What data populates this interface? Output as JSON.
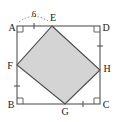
{
  "figure": {
    "outer_square": {
      "name": "ABCD",
      "corners": [
        {
          "label": "A",
          "position": "top-left",
          "x": 17,
          "y": 26
        },
        {
          "label": "D",
          "position": "top-right",
          "x": 100,
          "y": 26
        },
        {
          "label": "C",
          "position": "bottom-right",
          "x": 100,
          "y": 104
        },
        {
          "label": "B",
          "position": "bottom-left",
          "x": 17,
          "y": 104
        }
      ]
    },
    "inner_square": {
      "name": "EFGH",
      "fill_color": "#d4d4d4",
      "stroke_color": "#4a4a4a",
      "vertices": [
        {
          "label": "E",
          "lies_on": "AD",
          "x": 52,
          "y": 26
        },
        {
          "label": "H",
          "lies_on": "DC",
          "x": 100,
          "y": 70
        },
        {
          "label": "G",
          "lies_on": "BC",
          "x": 65,
          "y": 104
        },
        {
          "label": "F",
          "lies_on": "AB",
          "x": 17,
          "y": 65
        }
      ]
    },
    "measurements": [
      {
        "label": "6",
        "segment": "AE",
        "style": "dotted-arc"
      }
    ],
    "tick_marks": [
      {
        "segment": "AE",
        "count": 1
      },
      {
        "segment": "FB",
        "count": 1
      },
      {
        "segment": "DH",
        "count": 1
      },
      {
        "segment": "GC",
        "count": 1
      }
    ],
    "right_angle_markers": [
      "A",
      "B",
      "C",
      "D"
    ],
    "colors": {
      "outer_stroke": "#555555",
      "inner_stroke": "#4a4a4a",
      "inner_fill": "#d4d4d4",
      "label_text": "#1a1a1a",
      "tick_mark": "#555555",
      "background": "#ffffff"
    }
  }
}
